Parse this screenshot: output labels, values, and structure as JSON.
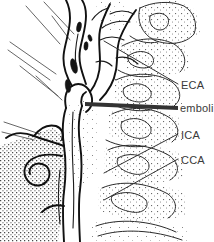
{
  "figure": {
    "kind": "anatomical-line-drawing",
    "background_color": "#ffffff",
    "ink_color": "#111111",
    "text_color": "#3a3a3a",
    "width": 214,
    "height": 242
  },
  "labels": [
    {
      "id": "eca",
      "text": "ECA",
      "x": 181,
      "y": 79,
      "leader": {
        "x1": 104,
        "y1": 41,
        "x2": 178,
        "y2": 84
      }
    },
    {
      "id": "emboli",
      "text": "emboli",
      "x": 180,
      "y": 102,
      "leader": {
        "x1": 85,
        "y1": 104,
        "x2": 178,
        "y2": 108
      }
    },
    {
      "id": "ica",
      "text": "ICA",
      "x": 181,
      "y": 129,
      "leader": {
        "x1": 104,
        "y1": 173,
        "x2": 178,
        "y2": 134
      }
    },
    {
      "id": "cca",
      "text": "CCA",
      "x": 181,
      "y": 154,
      "leader": {
        "x1": 104,
        "y1": 200,
        "x2": 178,
        "y2": 159
      }
    }
  ],
  "emboli_markers": [
    {
      "cx": 74,
      "cy": 66,
      "rx": 3.0,
      "ry": 7.5,
      "rot": -14
    },
    {
      "cx": 68,
      "cy": 86,
      "rx": 2.6,
      "ry": 6.5,
      "rot": -8
    },
    {
      "cx": 79,
      "cy": 27,
      "rx": 2.2,
      "ry": 5.0,
      "rot": 10
    },
    {
      "cx": 86,
      "cy": 46,
      "rx": 2.0,
      "ry": 4.2,
      "rot": 4
    },
    {
      "cx": 90,
      "cy": 38,
      "rx": 1.7,
      "ry": 3.4,
      "rot": -20
    }
  ]
}
